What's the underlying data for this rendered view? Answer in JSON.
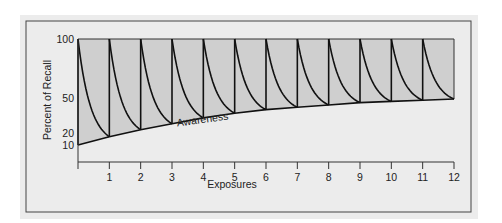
{
  "chart_data": {
    "type": "line",
    "title": "",
    "xlabel": "Exposures",
    "ylabel": "Percent of Recall",
    "xlim": [
      0,
      12
    ],
    "ylim": [
      0,
      100
    ],
    "x_ticks": [
      "1",
      "2",
      "3",
      "4",
      "5",
      "6",
      "7",
      "8",
      "9",
      "10",
      "11",
      "12"
    ],
    "y_ticks": [
      "100",
      "50",
      "20",
      "10"
    ],
    "grid": false,
    "legend": null,
    "annotations": [
      "Awareness"
    ],
    "series": [
      {
        "name": "Awareness",
        "x": [
          0,
          1,
          2,
          3,
          4,
          5,
          6,
          7,
          8,
          9,
          10,
          11,
          12
        ],
        "values": [
          10,
          17,
          23,
          28,
          33,
          37,
          40,
          42,
          44,
          46,
          47,
          48,
          49
        ]
      },
      {
        "name": "Recall after each exposure (peak)",
        "x": [
          0,
          1,
          2,
          3,
          4,
          5,
          6,
          7,
          8,
          9,
          10,
          11
        ],
        "values": [
          100,
          100,
          100,
          100,
          100,
          100,
          100,
          100,
          100,
          100,
          100,
          100
        ]
      }
    ]
  }
}
